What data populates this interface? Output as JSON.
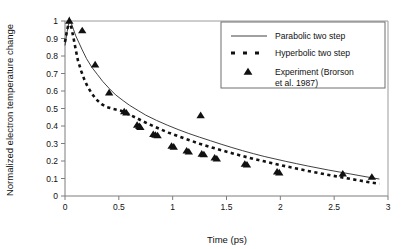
{
  "chart_data": {
    "type": "line",
    "title": "",
    "xlabel": "Time (ps)",
    "ylabel": "Normalized electron temperature change",
    "xlim": [
      0,
      3
    ],
    "ylim": [
      0,
      1
    ],
    "xticks": [
      0,
      0.5,
      1,
      1.5,
      2,
      2.5,
      3
    ],
    "xticklabels": [
      "0",
      "0.5",
      "1",
      "1.5",
      "2",
      "2.5",
      "3"
    ],
    "yticks": [
      0,
      0.1,
      0.2,
      0.3,
      0.4,
      0.5,
      0.6,
      0.7,
      0.8,
      0.9,
      1
    ],
    "yticklabels": [
      "0",
      "0.1",
      "0.2",
      "0.3",
      "0.4",
      "0.5",
      "0.6",
      "0.7",
      "0.8",
      "0.9",
      "1"
    ],
    "grid": false,
    "legend_position": "upper right",
    "series": [
      {
        "name": "Parabolic two step",
        "style": "solid-line",
        "points": [
          [
            0.0,
            0.86
          ],
          [
            0.02,
            0.94
          ],
          [
            0.04,
            1.0
          ],
          [
            0.06,
            0.985
          ],
          [
            0.08,
            0.95
          ],
          [
            0.1,
            0.915
          ],
          [
            0.13,
            0.875
          ],
          [
            0.16,
            0.835
          ],
          [
            0.2,
            0.785
          ],
          [
            0.25,
            0.735
          ],
          [
            0.3,
            0.695
          ],
          [
            0.35,
            0.655
          ],
          [
            0.41,
            0.615
          ],
          [
            0.47,
            0.578
          ],
          [
            0.54,
            0.545
          ],
          [
            0.6,
            0.518
          ],
          [
            0.68,
            0.488
          ],
          [
            0.75,
            0.462
          ],
          [
            0.85,
            0.432
          ],
          [
            0.95,
            0.405
          ],
          [
            1.05,
            0.38
          ],
          [
            1.15,
            0.357
          ],
          [
            1.25,
            0.336
          ],
          [
            1.35,
            0.316
          ],
          [
            1.45,
            0.296
          ],
          [
            1.55,
            0.277
          ],
          [
            1.65,
            0.259
          ],
          [
            1.75,
            0.242
          ],
          [
            1.85,
            0.226
          ],
          [
            1.95,
            0.212
          ],
          [
            2.05,
            0.198
          ],
          [
            2.15,
            0.185
          ],
          [
            2.25,
            0.172
          ],
          [
            2.35,
            0.16
          ],
          [
            2.45,
            0.148
          ],
          [
            2.55,
            0.137
          ],
          [
            2.65,
            0.126
          ],
          [
            2.75,
            0.115
          ],
          [
            2.85,
            0.104
          ],
          [
            2.92,
            0.097
          ]
        ]
      },
      {
        "name": "Hyperbolic two step",
        "style": "dashed-line",
        "points": [
          [
            0.0,
            0.88
          ],
          [
            0.02,
            0.95
          ],
          [
            0.04,
            1.0
          ],
          [
            0.06,
            0.96
          ],
          [
            0.08,
            0.9
          ],
          [
            0.1,
            0.835
          ],
          [
            0.12,
            0.775
          ],
          [
            0.15,
            0.715
          ],
          [
            0.18,
            0.665
          ],
          [
            0.21,
            0.625
          ],
          [
            0.25,
            0.585
          ],
          [
            0.29,
            0.552
          ],
          [
            0.34,
            0.525
          ],
          [
            0.39,
            0.508
          ],
          [
            0.45,
            0.497
          ],
          [
            0.52,
            0.487
          ],
          [
            0.58,
            0.47
          ],
          [
            0.65,
            0.45
          ],
          [
            0.72,
            0.428
          ],
          [
            0.8,
            0.405
          ],
          [
            0.88,
            0.383
          ],
          [
            0.96,
            0.362
          ],
          [
            1.05,
            0.342
          ],
          [
            1.15,
            0.32
          ],
          [
            1.25,
            0.299
          ],
          [
            1.35,
            0.28
          ],
          [
            1.45,
            0.262
          ],
          [
            1.55,
            0.245
          ],
          [
            1.65,
            0.228
          ],
          [
            1.75,
            0.212
          ],
          [
            1.85,
            0.198
          ],
          [
            1.95,
            0.184
          ],
          [
            2.05,
            0.17
          ],
          [
            2.15,
            0.157
          ],
          [
            2.25,
            0.144
          ],
          [
            2.35,
            0.132
          ],
          [
            2.45,
            0.12
          ],
          [
            2.55,
            0.109
          ],
          [
            2.65,
            0.098
          ],
          [
            2.75,
            0.087
          ],
          [
            2.85,
            0.076
          ],
          [
            2.92,
            0.07
          ]
        ]
      },
      {
        "name": "Experiment (Brorson et al. 1987)",
        "style": "triangle-markers",
        "points": [
          [
            0.04,
            1.0
          ],
          [
            0.16,
            0.945
          ],
          [
            0.28,
            0.75
          ],
          [
            0.41,
            0.59
          ],
          [
            0.55,
            0.482
          ],
          [
            0.57,
            0.475
          ],
          [
            0.67,
            0.405
          ],
          [
            0.69,
            0.398
          ],
          [
            0.7,
            0.392
          ],
          [
            0.82,
            0.352
          ],
          [
            0.84,
            0.348
          ],
          [
            0.86,
            0.345
          ],
          [
            0.99,
            0.285
          ],
          [
            1.01,
            0.28
          ],
          [
            1.13,
            0.258
          ],
          [
            1.15,
            0.252
          ],
          [
            1.26,
            0.46
          ],
          [
            1.27,
            0.24
          ],
          [
            1.29,
            0.236
          ],
          [
            1.39,
            0.218
          ],
          [
            1.41,
            0.212
          ],
          [
            1.67,
            0.182
          ],
          [
            1.69,
            0.178
          ],
          [
            1.97,
            0.138
          ],
          [
            1.99,
            0.133
          ],
          [
            2.58,
            0.126
          ],
          [
            2.85,
            0.108
          ]
        ]
      }
    ],
    "legend_entries": [
      {
        "label": "Parabolic two step",
        "marker": "solid-line"
      },
      {
        "label": "Hyperbolic two step",
        "marker": "dashed-line"
      },
      {
        "label": "Experiment (Brorson",
        "label_line2": "et al. 1987)",
        "marker": "triangle"
      }
    ]
  }
}
